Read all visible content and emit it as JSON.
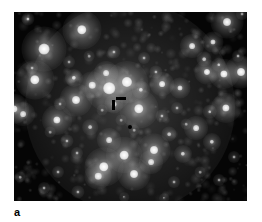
{
  "figure": {
    "panel_label": "a",
    "type": "astronomical-image",
    "colors": {
      "background": "#ffffff",
      "sky_background": "#050505",
      "star": "#ffffff",
      "marker": "#000000"
    },
    "frame": {
      "x": 14,
      "y": 12,
      "width": 233,
      "height": 189
    }
  },
  "markers": {
    "target_marker": {
      "name": "angle-pointer",
      "shape": "corner-bracket",
      "color": "#000000",
      "x": 118,
      "y": 101,
      "h_bar": {
        "x": 116,
        "y": 97,
        "width": 10,
        "height": 3
      },
      "v_bar": {
        "x": 112,
        "y": 100,
        "width": 3,
        "height": 10
      }
    },
    "secondary_dot": {
      "name": "reference-dot",
      "color": "#000000",
      "x": 130,
      "y": 127,
      "radius": 2
    }
  },
  "chart_data": {
    "type": "scatter",
    "title": "",
    "xlabel": "",
    "ylabel": "",
    "xlim": [
      0,
      233
    ],
    "ylim": [
      0,
      189
    ],
    "grid": false,
    "legend": false,
    "note": "Star positions and apparent brightness (radius in px, intensity 0-1) read off the grayscale frame; coordinates are relative to the image frame origin.",
    "stars": [
      {
        "x": 14,
        "y": 7,
        "r": 2.2,
        "i": 0.7
      },
      {
        "x": 68,
        "y": 18,
        "r": 6.5,
        "i": 1.0
      },
      {
        "x": 30,
        "y": 37,
        "r": 7.5,
        "i": 1.0
      },
      {
        "x": 18,
        "y": 56,
        "r": 2.0,
        "i": 0.55
      },
      {
        "x": 21,
        "y": 68,
        "r": 6.5,
        "i": 1.0
      },
      {
        "x": 60,
        "y": 66,
        "r": 3.0,
        "i": 0.75
      },
      {
        "x": 92,
        "y": 61,
        "r": 4.0,
        "i": 0.82
      },
      {
        "x": 95,
        "y": 76,
        "r": 8.0,
        "i": 1.0
      },
      {
        "x": 78,
        "y": 73,
        "r": 4.5,
        "i": 0.88
      },
      {
        "x": 113,
        "y": 70,
        "r": 7.0,
        "i": 1.0
      },
      {
        "x": 127,
        "y": 78,
        "r": 3.0,
        "i": 0.72
      },
      {
        "x": 148,
        "y": 72,
        "r": 4.0,
        "i": 0.9
      },
      {
        "x": 62,
        "y": 88,
        "r": 5.5,
        "i": 0.95
      },
      {
        "x": 100,
        "y": 92,
        "r": 3.2,
        "i": 0.7
      },
      {
        "x": 125,
        "y": 97,
        "r": 6.5,
        "i": 0.98
      },
      {
        "x": 166,
        "y": 76,
        "r": 3.5,
        "i": 0.8
      },
      {
        "x": 178,
        "y": 34,
        "r": 4.0,
        "i": 0.85
      },
      {
        "x": 199,
        "y": 30,
        "r": 3.5,
        "i": 0.8
      },
      {
        "x": 190,
        "y": 47,
        "r": 2.5,
        "i": 0.65
      },
      {
        "x": 205,
        "y": 53,
        "r": 2.4,
        "i": 0.62
      },
      {
        "x": 193,
        "y": 60,
        "r": 4.2,
        "i": 0.92
      },
      {
        "x": 210,
        "y": 62,
        "r": 5.0,
        "i": 0.95
      },
      {
        "x": 227,
        "y": 60,
        "r": 5.5,
        "i": 0.98
      },
      {
        "x": 224,
        "y": 44,
        "r": 2.0,
        "i": 0.55
      },
      {
        "x": 213,
        "y": 10,
        "r": 5.5,
        "i": 0.92
      },
      {
        "x": 228,
        "y": 2,
        "r": 2.0,
        "i": 0.5
      },
      {
        "x": 0,
        "y": 97,
        "r": 5.0,
        "i": 0.9
      },
      {
        "x": 9,
        "y": 102,
        "r": 4.0,
        "i": 0.82
      },
      {
        "x": 43,
        "y": 108,
        "r": 5.0,
        "i": 0.92
      },
      {
        "x": 76,
        "y": 115,
        "r": 2.6,
        "i": 0.62
      },
      {
        "x": 95,
        "y": 128,
        "r": 4.0,
        "i": 0.8
      },
      {
        "x": 53,
        "y": 129,
        "r": 2.2,
        "i": 0.58
      },
      {
        "x": 63,
        "y": 141,
        "r": 2.0,
        "i": 0.55
      },
      {
        "x": 110,
        "y": 143,
        "r": 6.0,
        "i": 1.0
      },
      {
        "x": 140,
        "y": 138,
        "r": 5.5,
        "i": 0.98
      },
      {
        "x": 137,
        "y": 150,
        "r": 4.0,
        "i": 0.82
      },
      {
        "x": 155,
        "y": 122,
        "r": 2.5,
        "i": 0.62
      },
      {
        "x": 169,
        "y": 142,
        "r": 3.0,
        "i": 0.7
      },
      {
        "x": 182,
        "y": 116,
        "r": 4.0,
        "i": 0.85
      },
      {
        "x": 198,
        "y": 130,
        "r": 3.0,
        "i": 0.7
      },
      {
        "x": 196,
        "y": 100,
        "r": 2.4,
        "i": 0.6
      },
      {
        "x": 212,
        "y": 96,
        "r": 5.0,
        "i": 0.92
      },
      {
        "x": 148,
        "y": 104,
        "r": 2.2,
        "i": 0.58
      },
      {
        "x": 163,
        "y": 96,
        "r": 2.0,
        "i": 0.55
      },
      {
        "x": 90,
        "y": 155,
        "r": 6.5,
        "i": 1.0
      },
      {
        "x": 84,
        "y": 164,
        "r": 4.5,
        "i": 0.88
      },
      {
        "x": 120,
        "y": 162,
        "r": 5.5,
        "i": 0.96
      },
      {
        "x": 44,
        "y": 160,
        "r": 2.0,
        "i": 0.55
      },
      {
        "x": 30,
        "y": 176,
        "r": 2.0,
        "i": 0.52
      },
      {
        "x": 64,
        "y": 180,
        "r": 2.2,
        "i": 0.55
      },
      {
        "x": 6,
        "y": 165,
        "r": 1.8,
        "i": 0.45
      },
      {
        "x": 160,
        "y": 170,
        "r": 2.0,
        "i": 0.5
      },
      {
        "x": 205,
        "y": 168,
        "r": 2.0,
        "i": 0.48
      },
      {
        "x": 220,
        "y": 145,
        "r": 2.0,
        "i": 0.5
      },
      {
        "x": 100,
        "y": 40,
        "r": 2.2,
        "i": 0.58
      },
      {
        "x": 130,
        "y": 46,
        "r": 2.0,
        "i": 0.52
      },
      {
        "x": 55,
        "y": 50,
        "r": 2.0,
        "i": 0.5
      },
      {
        "x": 46,
        "y": 92,
        "r": 2.0,
        "i": 0.5
      },
      {
        "x": 142,
        "y": 60,
        "r": 2.2,
        "i": 0.58
      },
      {
        "x": 75,
        "y": 44,
        "r": 1.8,
        "i": 0.45
      },
      {
        "x": 172,
        "y": 112,
        "r": 1.8,
        "i": 0.45
      },
      {
        "x": 120,
        "y": 118,
        "r": 1.8,
        "i": 0.45
      },
      {
        "x": 107,
        "y": 108,
        "r": 1.8,
        "i": 0.42
      },
      {
        "x": 88,
        "y": 98,
        "r": 1.8,
        "i": 0.42
      },
      {
        "x": 36,
        "y": 120,
        "r": 1.8,
        "i": 0.42
      },
      {
        "x": 186,
        "y": 160,
        "r": 1.8,
        "i": 0.42
      },
      {
        "x": 150,
        "y": 186,
        "r": 1.6,
        "i": 0.4
      },
      {
        "x": 110,
        "y": 185,
        "r": 1.6,
        "i": 0.4
      }
    ],
    "cluster_halo": {
      "center_x": 116,
      "center_y": 95,
      "radius": 105,
      "peak_intensity": 0.22
    }
  }
}
